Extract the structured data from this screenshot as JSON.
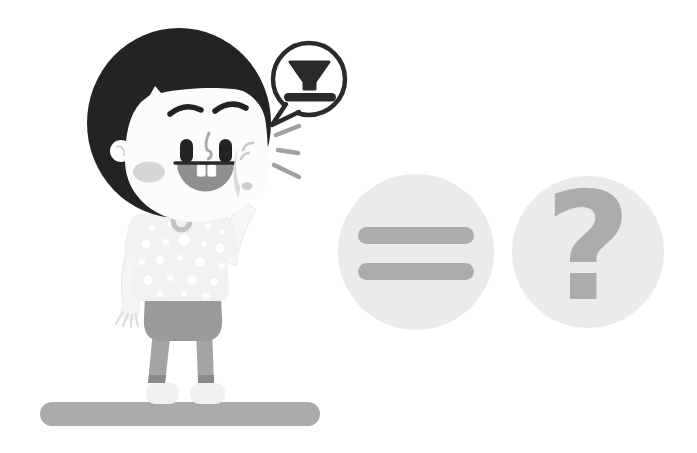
{
  "scene": {
    "type": "illustration",
    "alt_text": "A cartoon boy with a black bob haircut, white polka-dot shirt and gray shorts stands on a gray bar, cupping a hand beside his open mouth while shouting. A speech bubble above his head contains a black funnel shape resting on a line. To the right are two light gray circles: one holding an equals sign and one holding a question mark."
  },
  "speech_bubble": {
    "icon": "funnel-on-line-icon"
  },
  "symbols": {
    "equals": "=",
    "question_mark": "?"
  },
  "colors": {
    "background": "#ffffff",
    "hair": "#232321",
    "outline": "#2a2a28",
    "skin": "#fcfcfa",
    "cheek": "#d6d6d4",
    "mouth": "#8f8f8d",
    "shirt": "#f1f1ef",
    "polka_dot": "#ffffff",
    "collar_ring": "#c2c2c0",
    "shorts": "#9a9a98",
    "legs": "#a4a4a2",
    "shoes": "#f0f0ee",
    "platform": "#ababa9",
    "circle_fill": "#ebebe9",
    "symbol_gray": "#acacaa",
    "sound_lines": "#a0a09e"
  }
}
